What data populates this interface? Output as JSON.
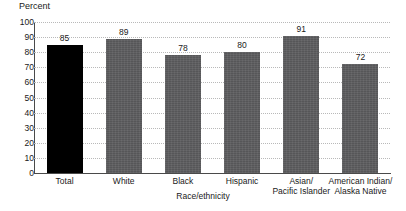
{
  "chart_data": {
    "type": "bar",
    "title": "",
    "subtitle": "",
    "xlabel": "Race/ethnicity",
    "ylabel": "Percent",
    "categories": [
      "Total",
      "White",
      "Black",
      "Hispanic",
      "Asian/ Pacific Islander",
      "American Indian/ Alaska Native"
    ],
    "category_lines": [
      [
        "Total"
      ],
      [
        "White"
      ],
      [
        "Black"
      ],
      [
        "Hispanic"
      ],
      [
        "Asian/",
        "Pacific Islander"
      ],
      [
        "American Indian/",
        "Alaska Native"
      ]
    ],
    "values": [
      85,
      89,
      78,
      80,
      91,
      72
    ],
    "value_labels": [
      "85",
      "89",
      "78",
      "80",
      "91",
      "72"
    ],
    "ylim": [
      0,
      100
    ],
    "yticks": [
      100,
      90,
      80,
      70,
      60,
      50,
      40,
      30,
      20,
      10,
      0
    ],
    "ytick_labels": [
      "100",
      "90",
      "80",
      "70",
      "60",
      "50",
      "40",
      "30",
      "20",
      "10",
      "0"
    ],
    "grid": true,
    "legend": "none",
    "highlight_index": 0,
    "colors": {
      "bar_default": "#5d5d5f",
      "bar_highlight": "#000000",
      "gridline": "#b9b9b9",
      "axis": "#4a4a4a",
      "text": "#1a1a1a",
      "background": "#ffffff"
    }
  }
}
